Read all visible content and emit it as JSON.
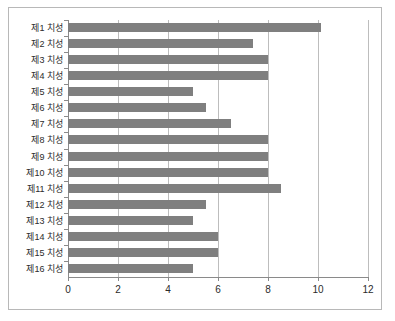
{
  "chart_data": {
    "type": "bar",
    "orientation": "horizontal",
    "title": "",
    "xlabel": "",
    "ylabel": "",
    "xlim": [
      0,
      12
    ],
    "xticks": [
      0,
      2,
      4,
      6,
      8,
      10,
      12
    ],
    "xtick_labels": [
      "0",
      "2",
      "4",
      "6",
      "8",
      "10",
      "12"
    ],
    "grid": "vertical",
    "legend": "none",
    "bar_color": "#7f7f7f",
    "background_color": "#ffffff",
    "categories": [
      "제1 치성",
      "제2 치성",
      "제3 치성",
      "제4 치성",
      "제5 치성",
      "제6 치성",
      "제7 치성",
      "제8 치성",
      "제9 치성",
      "제10 치성",
      "제11 치성",
      "제12 치성",
      "제13 치성",
      "제14 치성",
      "제15 치성",
      "제16 치성"
    ],
    "values": [
      10.1,
      7.4,
      8.0,
      8.0,
      5.0,
      5.5,
      6.5,
      8.0,
      8.0,
      8.0,
      8.5,
      5.5,
      5.0,
      6.0,
      6.0,
      5.0
    ]
  }
}
